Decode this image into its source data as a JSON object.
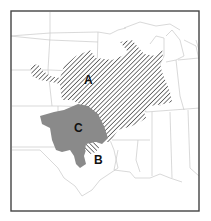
{
  "map": {
    "title": "",
    "regions": [
      {
        "id": "A",
        "label": "A",
        "fill": "hatched",
        "color": "#333333"
      },
      {
        "id": "B",
        "label": "B",
        "fill": "hatched-reverse",
        "color": "#333333"
      },
      {
        "id": "C",
        "label": "C",
        "fill": "solid",
        "color": "#8a8a8a"
      }
    ],
    "colors": {
      "background": "#ffffff",
      "frame": "#444444",
      "state_borders": "#c8c8c8",
      "hatch": "#333333",
      "solid_region": "#8a8a8a"
    }
  }
}
